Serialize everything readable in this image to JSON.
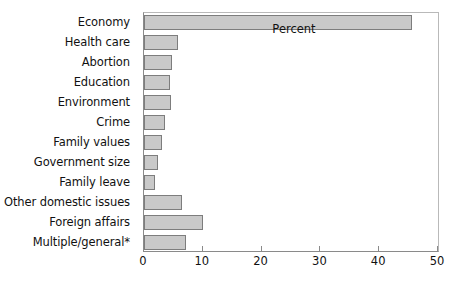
{
  "chart_data": {
    "type": "bar",
    "orientation": "horizontal",
    "title": "",
    "xlabel": "Percent",
    "ylabel": "",
    "xlim": [
      0,
      50
    ],
    "xticks": [
      0,
      10,
      20,
      30,
      40,
      50
    ],
    "grid": false,
    "legend": null,
    "categories": [
      "Economy",
      "Health care",
      "Abortion",
      "Education",
      "Environment",
      "Crime",
      "Family values",
      "Government size",
      "Family leave",
      "Other domestic issues",
      "Foreign affairs",
      "Multiple/general*"
    ],
    "values": [
      45.5,
      5.8,
      4.8,
      4.4,
      4.6,
      3.5,
      3.1,
      2.4,
      1.9,
      6.5,
      10.0,
      7.1
    ],
    "bar_fill_color": "#c9c9c9",
    "bar_border_color": "#7d7d7d"
  }
}
